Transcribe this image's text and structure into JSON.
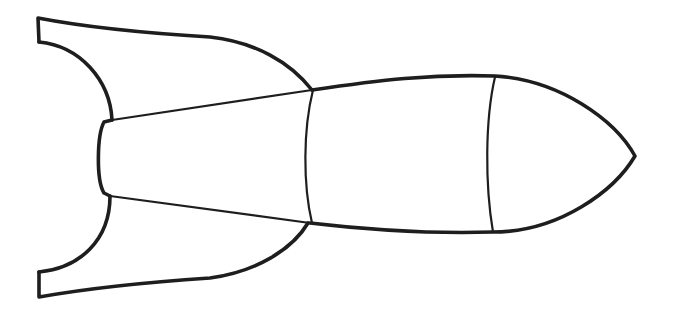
{
  "image": {
    "subject": "rocket-outline",
    "description": "Black line-art outline of a rocket pointing right with two tail fins, a nozzle, tapered tail section, body section and nose cone",
    "background_color": "#ffffff",
    "stroke_color": "#1e1e1e",
    "parts": [
      "top-fin",
      "bottom-fin",
      "nozzle",
      "tail-section",
      "body-section",
      "nose-cone"
    ]
  }
}
